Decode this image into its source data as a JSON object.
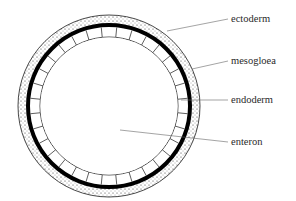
{
  "diagram": {
    "center": {
      "x": 109,
      "y": 106
    },
    "radii": {
      "ectoderm_outer": 91,
      "mesogloea_outer": 83,
      "mesogloea_inner": 79,
      "endoderm_inner": 69
    },
    "endoderm_cell_count": 32,
    "colors": {
      "line": "#1a1a1a",
      "mesogloea": "#000000",
      "leader": "#666666",
      "text": "#2a2a2a",
      "stipple": "#333333"
    },
    "labels": [
      {
        "id": "ectoderm",
        "text": "ectoderm",
        "x": 231,
        "y": 22,
        "line": {
          "x1": 167,
          "y1": 31,
          "x2": 228,
          "y2": 19
        }
      },
      {
        "id": "mesogloea",
        "text": "mesogloea",
        "x": 231,
        "y": 64,
        "line": {
          "x1": 192,
          "y1": 69,
          "x2": 228,
          "y2": 61
        }
      },
      {
        "id": "endoderm",
        "text": "endoderm",
        "x": 231,
        "y": 103,
        "line": {
          "x1": 181,
          "y1": 100,
          "x2": 228,
          "y2": 100
        }
      },
      {
        "id": "enteron",
        "text": "enteron",
        "x": 231,
        "y": 145,
        "line": {
          "x1": 120,
          "y1": 130,
          "x2": 228,
          "y2": 142
        }
      }
    ]
  }
}
